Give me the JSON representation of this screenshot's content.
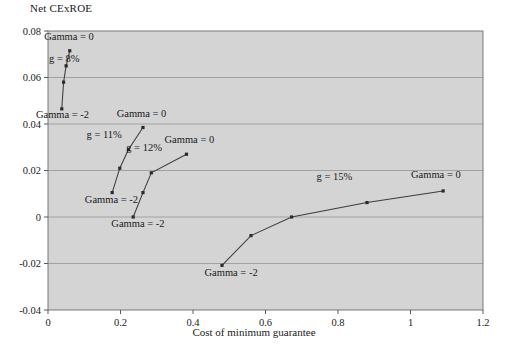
{
  "chart_data": {
    "type": "line",
    "title": "Net CExROE",
    "xlabel": "Cost of minimum guarantee",
    "ylabel": "Net CExROE",
    "xlim": [
      0,
      1.2
    ],
    "ylim": [
      -0.04,
      0.08
    ],
    "xticks": [
      "0",
      "0.2",
      "0.4",
      "0.6",
      "0.8",
      "1",
      "1.2"
    ],
    "xtick_values": [
      0,
      0.2,
      0.4,
      0.6,
      0.8,
      1.0,
      1.2
    ],
    "yticks": [
      "0.08",
      "0.06",
      "0.04",
      "0.02",
      "0",
      "-0.02",
      "-0.04"
    ],
    "ytick_values": [
      0.08,
      0.06,
      0.04,
      0.02,
      0,
      -0.02,
      -0.04
    ],
    "grid": true,
    "legend": "none",
    "plot_background": "#d4d4d4",
    "line_color": "#3c3c3c",
    "marker_color": "#2b2b2b",
    "series": [
      {
        "name": "g = 8%",
        "label_x": 0.045,
        "label_y": 0.0665,
        "start_annotation": "Gamma = -2",
        "end_annotation": "Gamma = 0",
        "points": [
          {
            "x": 0.038,
            "y": 0.0465
          },
          {
            "x": 0.043,
            "y": 0.058
          },
          {
            "x": 0.05,
            "y": 0.065
          },
          {
            "x": 0.06,
            "y": 0.0715
          }
        ]
      },
      {
        "name": "g = 11%",
        "label_x": 0.155,
        "label_y": 0.034,
        "start_annotation": "Gamma = -2",
        "end_annotation": "Gamma = 0",
        "points": [
          {
            "x": 0.177,
            "y": 0.0105
          },
          {
            "x": 0.198,
            "y": 0.021
          },
          {
            "x": 0.222,
            "y": 0.029
          },
          {
            "x": 0.262,
            "y": 0.0385
          }
        ]
      },
      {
        "name": "g = 12%",
        "label_x": 0.265,
        "label_y": 0.0285,
        "start_annotation": "Gamma = -2",
        "end_annotation": "Gamma = 0",
        "points": [
          {
            "x": 0.235,
            "y": 0.0
          },
          {
            "x": 0.262,
            "y": 0.0105
          },
          {
            "x": 0.285,
            "y": 0.019
          },
          {
            "x": 0.382,
            "y": 0.027
          }
        ]
      },
      {
        "name": "g = 15%",
        "label_x": 0.79,
        "label_y": 0.0158,
        "start_annotation": "Gamma = -2",
        "end_annotation": "Gamma = 0",
        "points": [
          {
            "x": 0.48,
            "y": -0.0208
          },
          {
            "x": 0.56,
            "y": -0.008
          },
          {
            "x": 0.672,
            "y": 0.0
          },
          {
            "x": 0.88,
            "y": 0.0062
          },
          {
            "x": 1.09,
            "y": 0.0112
          }
        ]
      }
    ],
    "annotations": [
      {
        "text": "Gamma = 0",
        "x": 0.058,
        "y": 0.0762,
        "anchor": "middle"
      },
      {
        "text": "Gamma = -2",
        "x": 0.04,
        "y": 0.0424,
        "anchor": "middle"
      },
      {
        "text": "Gamma = 0",
        "x": 0.258,
        "y": 0.043,
        "anchor": "middle"
      },
      {
        "text": "Gamma = -2",
        "x": 0.175,
        "y": 0.0062,
        "anchor": "middle"
      },
      {
        "text": "Gamma = 0",
        "x": 0.39,
        "y": 0.0318,
        "anchor": "middle"
      },
      {
        "text": "Gamma = -2",
        "x": 0.248,
        "y": -0.0045,
        "anchor": "middle"
      },
      {
        "text": "Gamma = -2",
        "x": 0.505,
        "y": -0.0255,
        "anchor": "middle"
      },
      {
        "text": "Gamma = 0",
        "x": 1.07,
        "y": 0.0168,
        "anchor": "middle"
      }
    ]
  }
}
